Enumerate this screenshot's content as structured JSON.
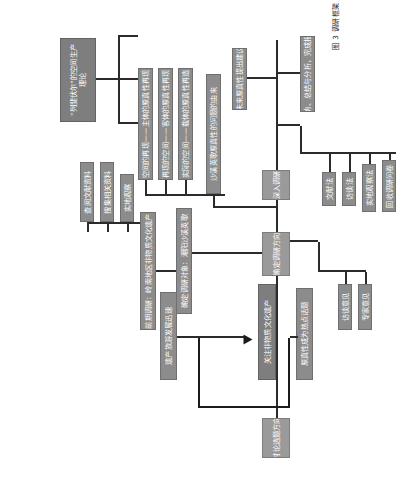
{
  "figure": {
    "caption": "图 3  调研框架",
    "colors": {
      "node_fill": "#8c8c8c",
      "node_fill_light": "#9a9a9a",
      "node_fill_dark": "#7e7e7e",
      "node_text": "#ffffff",
      "line": "#2b2b2b",
      "background": "#ffffff"
    }
  },
  "nodes": {
    "topic_direction": "讨论选题方向",
    "topic_hotspot": "原真性成为热点话题",
    "heritage_tourism_fast": "遗产旅游发展迅速",
    "focus_ich": "关注非物质文化遗产",
    "determine_research_direction": "确定调研方向",
    "literature_review": "查阅文献资料",
    "collect_materials": "搜集相关资料",
    "field_observation": "实地观察",
    "preliminary_survey": "前期调研：岭南地区非物质文化遗产",
    "research_object": "确定调研对象：潮阳沙溪英歌",
    "in_depth_survey": "深入调研",
    "interview": "访谈意见",
    "expert_opinion": "专家意见",
    "lefebvre_theory": "\"列斐伏尔\"的空间生产理论",
    "origin_of_authenticity": "沙溪英歌原真性的问题的由来",
    "space_representation": "空间的再现——主体的原真性再现",
    "representational_space": "再现的空间——客体的原真性再现",
    "spatial_practice": "实际的空间——载体的原真性再造",
    "future_suggestions": "未来原真性提出建议",
    "conclusion": "归纳、总结与分析，完成报告",
    "literature_method": "文献法",
    "interview_method": "访谈法",
    "field_survey_method": "实地观察法",
    "questionnaire_method": "回收调研问卷"
  },
  "groups": {
    "topic_group_label": "选题阶段",
    "method_group_label": "调研方法",
    "analysis_group_label": "分析阶段"
  }
}
